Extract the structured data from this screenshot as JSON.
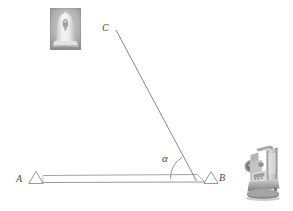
{
  "figure": {
    "type": "surveying-triangulation-diagram",
    "background_color": "#ffffff",
    "line_color": "#6e6e6e",
    "label_color": "#4a4a4a",
    "labels": {
      "point_a": "A",
      "point_b": "B",
      "point_c": "C",
      "angle": "α"
    },
    "points": {
      "a": {
        "x": 36,
        "y": 181
      },
      "b": {
        "x": 196,
        "y": 180
      },
      "c": {
        "x": 116,
        "y": 30
      }
    },
    "baseline": {
      "name": "baseline-strip",
      "from_x": 43,
      "to_x": 205,
      "top_y": 175,
      "bottom_y": 182
    },
    "angle_arc": {
      "name": "angle-alpha-arc",
      "vertex_x": 196,
      "vertex_y": 180,
      "radius": 26
    },
    "station_markers": [
      {
        "name": "station-marker-a",
        "label": "A",
        "cx": 36,
        "cy": 183,
        "half_width": 7,
        "height": 12
      },
      {
        "name": "station-marker-b",
        "label": "B",
        "cx": 211,
        "cy": 183,
        "half_width": 7,
        "height": 12
      }
    ],
    "photos": {
      "monument": {
        "name": "monument-photo",
        "caption": "",
        "subject": "bell-shaped stupa monument",
        "x": 50,
        "y": 8,
        "width": 31,
        "height": 42
      },
      "instrument": {
        "name": "total-station-photo",
        "caption": "",
        "subject": "total station theodolite on tribrach",
        "x": 236,
        "y": 141,
        "width": 50,
        "height": 62
      }
    }
  }
}
